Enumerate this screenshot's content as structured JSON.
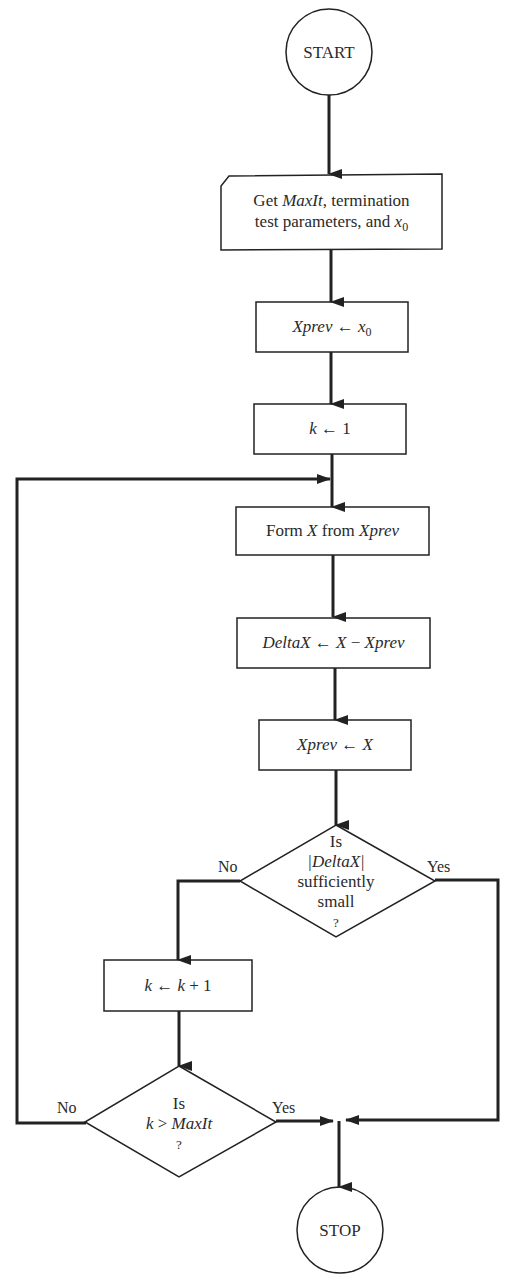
{
  "diagram": {
    "type": "flowchart",
    "colors": {
      "stroke": "#222222",
      "text": "#2a2a2a",
      "background": "#ffffff"
    },
    "nodes": [
      {
        "id": "start",
        "shape": "circle",
        "text": "START"
      },
      {
        "id": "input",
        "shape": "input-card",
        "line1_a": "Get ",
        "line1_b": "MaxIt",
        "line1_c": ", termination",
        "line2_a": "test parameters, and ",
        "line2_b": "x",
        "line2_sub": "0"
      },
      {
        "id": "init_xprev",
        "shape": "process",
        "a": "Xprev",
        "arrow": " ← ",
        "b": "x",
        "sub": "0"
      },
      {
        "id": "init_k",
        "shape": "process",
        "a": "k",
        "arrow": " ← ",
        "b": "1"
      },
      {
        "id": "form_x",
        "shape": "process",
        "a": "Form ",
        "b": "X",
        "c": " from ",
        "d": "Xprev"
      },
      {
        "id": "delta",
        "shape": "process",
        "a": "DeltaX",
        "arrow": " ← ",
        "b": "X",
        "c": " − ",
        "d": "Xprev"
      },
      {
        "id": "update_xprev",
        "shape": "process",
        "a": "Xprev",
        "arrow": " ← ",
        "b": "X"
      },
      {
        "id": "test_delta",
        "shape": "decision",
        "line1": "Is",
        "line2": "|DeltaX|",
        "line3": "sufficiently",
        "line4": "small",
        "line5": "?"
      },
      {
        "id": "inc_k",
        "shape": "process",
        "a": "k",
        "arrow": " ← ",
        "b": "k",
        "c": " + 1"
      },
      {
        "id": "test_k",
        "shape": "decision",
        "line1": "Is",
        "line2_a": "k",
        "line2_b": " > ",
        "line2_c": "MaxIt",
        "line3": "?"
      },
      {
        "id": "stop",
        "shape": "circle",
        "text": "STOP"
      }
    ],
    "edge_labels": {
      "test_delta_no": "No",
      "test_delta_yes": "Yes",
      "test_k_no": "No",
      "test_k_yes": "Yes"
    },
    "edges": [
      {
        "from": "start",
        "to": "input"
      },
      {
        "from": "input",
        "to": "init_xprev"
      },
      {
        "from": "init_xprev",
        "to": "init_k"
      },
      {
        "from": "init_k",
        "to": "form_x"
      },
      {
        "from": "form_x",
        "to": "delta"
      },
      {
        "from": "delta",
        "to": "update_xprev"
      },
      {
        "from": "update_xprev",
        "to": "test_delta"
      },
      {
        "from": "test_delta",
        "to": "inc_k",
        "label": "No"
      },
      {
        "from": "test_delta",
        "to": "stop",
        "label": "Yes"
      },
      {
        "from": "inc_k",
        "to": "test_k"
      },
      {
        "from": "test_k",
        "to": "form_x",
        "label": "No"
      },
      {
        "from": "test_k",
        "to": "stop",
        "label": "Yes"
      }
    ]
  }
}
